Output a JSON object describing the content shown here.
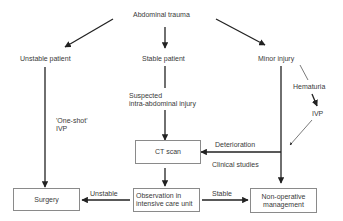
{
  "diagram": {
    "root": "Abdominal trauma",
    "branches": {
      "unstable": "Unstable patient",
      "stable": "Stable patient",
      "minor": "Minor injury"
    },
    "labels": {
      "suspected_line1": "Suspected",
      "suspected_line2": "intra-abdominal injury",
      "one_shot_line1": "'One-shot'",
      "one_shot_line2": "IVP",
      "hematuria": "Hematuria",
      "ivp": "IVP",
      "deterioration": "Deterioration",
      "clinical_studies": "Clinical studies",
      "unstable_edge": "Unstable",
      "stable_edge": "Stable"
    },
    "boxes": {
      "ct_scan": "CT scan",
      "surgery": "Surgery",
      "observation_line1": "Observation in",
      "observation_line2": "intensive care unit",
      "nonop_line1": "Non-operative",
      "nonop_line2": "management"
    },
    "colors": {
      "line": "#222222",
      "box_border": "#8a8a8a",
      "text": "#3a3a3a"
    }
  }
}
